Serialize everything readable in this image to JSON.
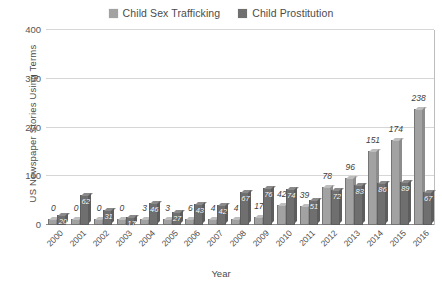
{
  "chart_data": {
    "type": "bar",
    "title": "",
    "subtitle": "",
    "xlabel": "Year",
    "ylabel": "US Newspaper Stories Using Terms",
    "ylim": [
      0,
      400
    ],
    "yticks": [
      0,
      100,
      200,
      300,
      400
    ],
    "grid": true,
    "legend_position": "top-center",
    "style": "3d-grouped-columns",
    "categories": [
      "2000",
      "2001",
      "2002",
      "2003",
      "2004",
      "2005",
      "2006",
      "2007",
      "2008",
      "2009",
      "2010",
      "2011",
      "2012",
      "2013",
      "2014",
      "2015",
      "2016"
    ],
    "series": [
      {
        "name": "Child Sex Trafficking",
        "color": "#a2a2a2",
        "values": [
          0,
          0,
          0,
          0,
          3,
          3,
          6,
          4,
          4,
          17,
          42,
          39,
          78,
          96,
          151,
          174,
          238
        ]
      },
      {
        "name": "Child Prostitution",
        "color": "#6f6f6f",
        "values": [
          20,
          62,
          31,
          17,
          46,
          27,
          43,
          42,
          67,
          76,
          74,
          51,
          72,
          83,
          86,
          89,
          67
        ]
      }
    ]
  },
  "legend": {
    "items": [
      {
        "label": "Child Sex Trafficking",
        "swatch_name": "legend-swatch-child-sex-trafficking"
      },
      {
        "label": "Child Prostitution",
        "swatch_name": "legend-swatch-child-prostitution"
      }
    ]
  },
  "colors": {
    "series_light": "#a2a2a2",
    "series_dark": "#6f6f6f",
    "gridline": "#d6d6d6",
    "axis": "#8d8d8d",
    "text": "#4b4b4b",
    "inner_label": "#ffffff"
  }
}
